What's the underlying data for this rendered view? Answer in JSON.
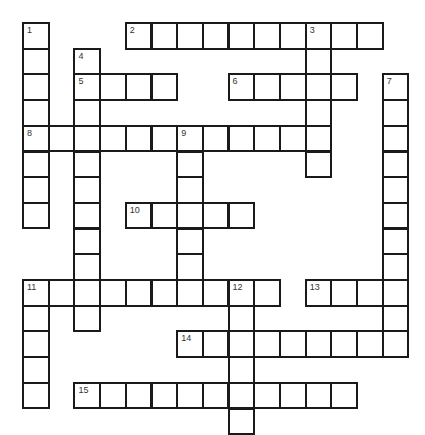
{
  "puzzle": {
    "title": "Crossword",
    "cell_size": 25.7,
    "origin": {
      "x": 23,
      "y": 23
    },
    "words": [
      {
        "number": 1,
        "direction": "down",
        "row": 0,
        "col": 0,
        "length": 8
      },
      {
        "number": 2,
        "direction": "across",
        "row": 0,
        "col": 4,
        "length": 10
      },
      {
        "number": 3,
        "direction": "down",
        "row": 0,
        "col": 11,
        "length": 6
      },
      {
        "number": 4,
        "direction": "down",
        "row": 1,
        "col": 2,
        "length": 11
      },
      {
        "number": 5,
        "direction": "across",
        "row": 2,
        "col": 2,
        "length": 4
      },
      {
        "number": 6,
        "direction": "across",
        "row": 2,
        "col": 8,
        "length": 5
      },
      {
        "number": 7,
        "direction": "down",
        "row": 2,
        "col": 14,
        "length": 11
      },
      {
        "number": 8,
        "direction": "across",
        "row": 4,
        "col": 0,
        "length": 12
      },
      {
        "number": 9,
        "direction": "down",
        "row": 4,
        "col": 6,
        "length": 6
      },
      {
        "number": 10,
        "direction": "across",
        "row": 7,
        "col": 4,
        "length": 5
      },
      {
        "number": 11,
        "direction": "across",
        "row": 10,
        "col": 0,
        "length": 10
      },
      {
        "number": 11,
        "direction": "down",
        "row": 10,
        "col": 0,
        "length": 5
      },
      {
        "number": 12,
        "direction": "down",
        "row": 10,
        "col": 8,
        "length": 6
      },
      {
        "number": 13,
        "direction": "across",
        "row": 10,
        "col": 11,
        "length": 4
      },
      {
        "number": 14,
        "direction": "across",
        "row": 12,
        "col": 6,
        "length": 9
      },
      {
        "number": 15,
        "direction": "across",
        "row": 14,
        "col": 2,
        "length": 11
      }
    ]
  }
}
